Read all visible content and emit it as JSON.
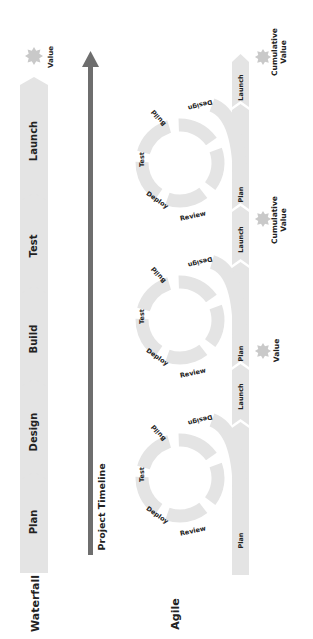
{
  "colors": {
    "chevron_fill": "#e4e4e4",
    "arrow": "#6e6e6e",
    "star": "#c9c9c9",
    "text": "#222222",
    "background": "#ffffff"
  },
  "waterfall": {
    "label": "Waterfall",
    "phases": [
      "Plan",
      "Design",
      "Build",
      "Test",
      "Launch"
    ],
    "end_marker": {
      "icon": "star-icon",
      "label": "Value"
    }
  },
  "timeline": {
    "label": "Project Timeline",
    "direction": "up"
  },
  "agile": {
    "label": "Agile",
    "iterations": [
      {
        "track": [
          "Plan",
          "Launch"
        ],
        "cycle": [
          "Design",
          "Build",
          "Test",
          "Deploy",
          "Review"
        ],
        "marker": {
          "icon": "star-icon",
          "label": "Value"
        }
      },
      {
        "track": [
          "Plan",
          "Launch"
        ],
        "cycle": [
          "Design",
          "Build",
          "Test",
          "Deploy",
          "Review"
        ],
        "marker": {
          "icon": "star-icon",
          "label": "Cumulative Value"
        }
      },
      {
        "track": [
          "Plan",
          "Launch"
        ],
        "cycle": [
          "Design",
          "Build",
          "Test",
          "Deploy",
          "Review"
        ],
        "marker": {
          "icon": "star-icon",
          "label": "Cumulative Value"
        }
      }
    ],
    "marker_labels": {
      "value": "Value",
      "cumulative_line1": "Cumulative",
      "cumulative_line2": "Value"
    }
  }
}
